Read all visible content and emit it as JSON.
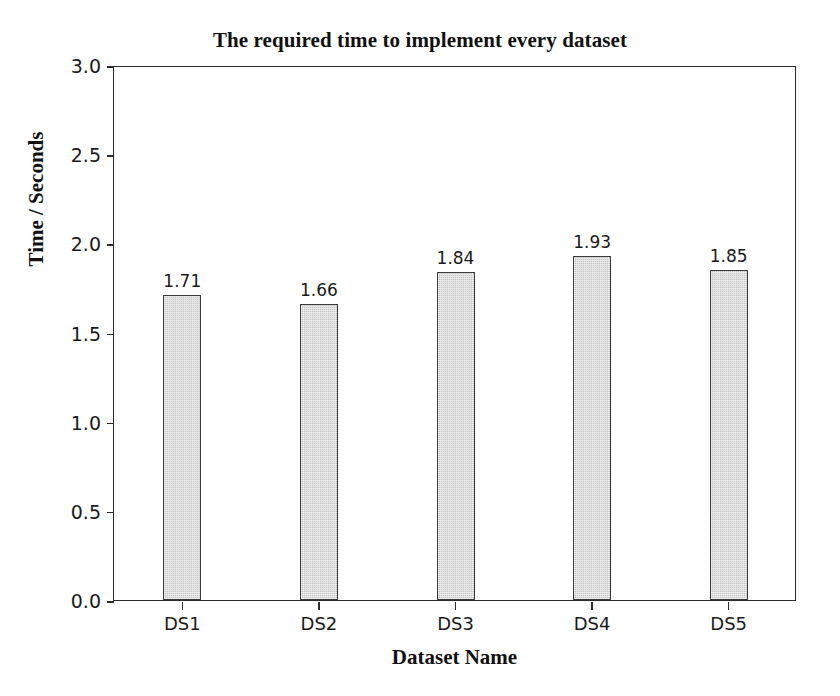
{
  "chart_data": {
    "type": "bar",
    "title": "The required time to implement every dataset",
    "xlabel": "Dataset Name",
    "ylabel": "Time / Seconds",
    "categories": [
      "DS1",
      "DS2",
      "DS3",
      "DS4",
      "DS5"
    ],
    "values": [
      1.71,
      1.66,
      1.84,
      1.93,
      1.85
    ],
    "value_labels": [
      "1.71",
      "1.66",
      "1.84",
      "1.93",
      "1.85"
    ],
    "ylim": [
      0.0,
      3.0
    ],
    "ytick_labels": [
      "0.0",
      "0.5",
      "1.0",
      "1.5",
      "2.0",
      "2.5",
      "3.0"
    ],
    "ytick_values": [
      0.0,
      0.5,
      1.0,
      1.5,
      2.0,
      2.5,
      3.0
    ],
    "grid": false,
    "legend": false,
    "bar_fill_color": "#c4c4c4",
    "bar_edge_color": "#3a3a3a",
    "axis_color": "#2b2b2b",
    "background_color": "#ffffff",
    "series": [
      {
        "name": "Time / Seconds",
        "values": [
          1.71,
          1.66,
          1.84,
          1.93,
          1.85
        ]
      }
    ]
  }
}
